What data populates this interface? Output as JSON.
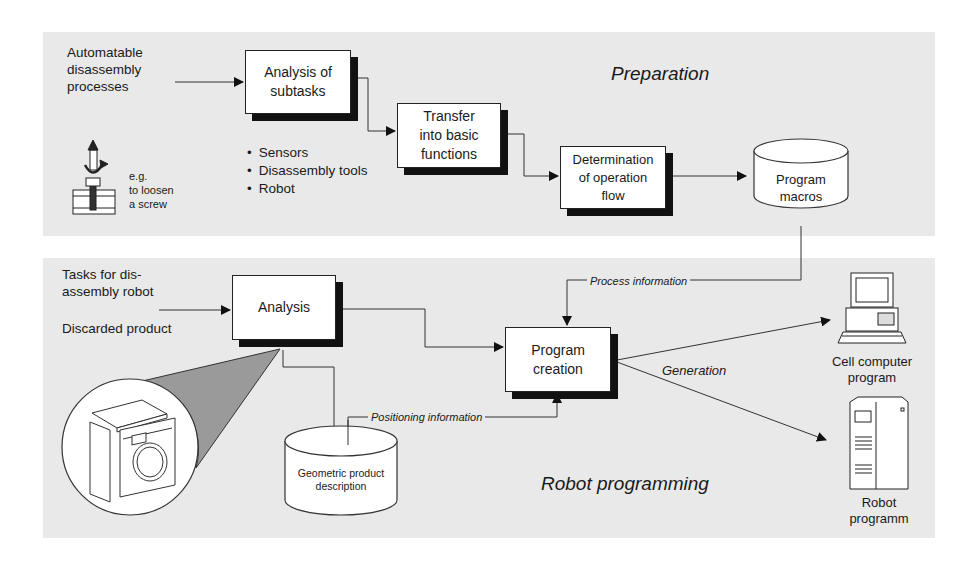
{
  "preparation": {
    "heading": "Preparation",
    "input_label": [
      "Automatable",
      "disassembly",
      "processes"
    ],
    "example_label": [
      "e.g.",
      "to loosen",
      "a screw"
    ],
    "boxes": {
      "analysis_subtasks": [
        "Analysis of",
        "subtasks"
      ],
      "transfer": [
        "Transfer",
        "into basic",
        "functions"
      ],
      "determination": [
        "Determination",
        "of operation",
        "flow"
      ]
    },
    "bullets": [
      "Sensors",
      "Disassembly tools",
      "Robot"
    ],
    "database": [
      "Program",
      "macros"
    ]
  },
  "robot_programming": {
    "heading": "Robot programming",
    "input_label_1": [
      "Tasks for dis-",
      "assembly robot"
    ],
    "input_label_2": "Discarded product",
    "boxes": {
      "analysis": "Analysis",
      "program_creation": [
        "Program",
        "creation"
      ]
    },
    "database": [
      "Geometric product",
      "description"
    ],
    "flow_labels": {
      "process_information": "Process information",
      "positioning_information": "Positioning information",
      "generation": "Generation"
    },
    "outputs": {
      "cell_computer": [
        "Cell computer",
        "program"
      ],
      "robot": [
        "Robot",
        "programm"
      ]
    }
  },
  "colors": {
    "panel_bg": "#e9e9e9",
    "box_bg": "#ffffff",
    "line": "#222222",
    "shadow": "#111111",
    "zoom_cone": "#9a9a9a"
  }
}
